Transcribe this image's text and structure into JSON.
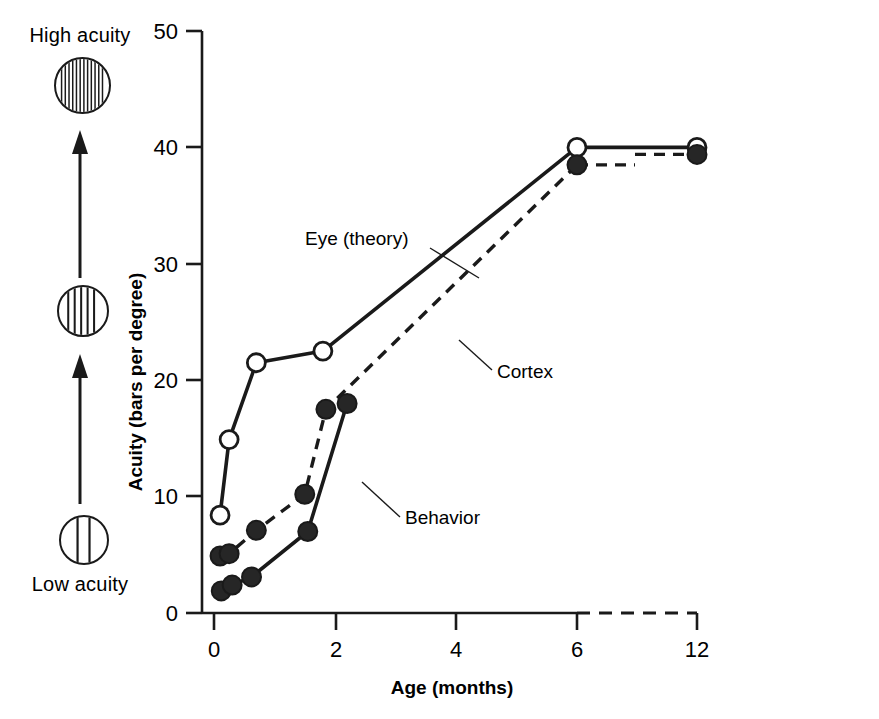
{
  "figure": {
    "acuity_scale": {
      "high_label": "High acuity",
      "low_label": "Low acuity",
      "gratings": [
        {
          "name": "high-acuity-grating",
          "bars": 13
        },
        {
          "name": "medium-acuity-grating",
          "bars": 6
        },
        {
          "name": "low-acuity-grating",
          "bars": 2
        }
      ]
    },
    "axes": {
      "y_title": "Acuity (bars per degree)",
      "x_title": "Age (months)",
      "y_ticks": [
        "0",
        "10",
        "20",
        "30",
        "40",
        "50"
      ],
      "x_ticks": [
        "0",
        "2",
        "4",
        "6",
        "12"
      ]
    },
    "annotations": {
      "eye_theory": "Eye (theory)",
      "cortex": "Cortex",
      "behavior": "Behavior"
    },
    "colors": {
      "ink": "#1a1a1a",
      "open_marker_fill": "#ffffff",
      "closed_marker_fill": "#262626"
    }
  },
  "chart_data": {
    "type": "line",
    "title": "",
    "xlabel": "Age (months)",
    "ylabel": "Acuity (bars per degree)",
    "xlim": [
      0,
      12
    ],
    "ylim": [
      0,
      50
    ],
    "x_ticks": [
      0,
      2,
      4,
      6,
      12
    ],
    "y_ticks": [
      0,
      10,
      20,
      30,
      40,
      50
    ],
    "grid": false,
    "legend": "inline annotations",
    "axis_break": {
      "between": [
        6,
        12
      ],
      "style": "dashed"
    },
    "series": [
      {
        "name": "Eye (theory)",
        "marker": "open-circle",
        "line": "solid",
        "points": [
          {
            "x": 0.1,
            "y": 8.4
          },
          {
            "x": 0.25,
            "y": 14.9
          },
          {
            "x": 0.7,
            "y": 21.5
          },
          {
            "x": 1.8,
            "y": 22.5
          },
          {
            "x": 6.0,
            "y": 40.0
          },
          {
            "x": 12.0,
            "y": 40.0
          }
        ]
      },
      {
        "name": "Cortex",
        "marker": "filled-circle",
        "line": "dashed",
        "points": [
          {
            "x": 0.1,
            "y": 4.9
          },
          {
            "x": 0.25,
            "y": 5.1
          },
          {
            "x": 0.7,
            "y": 7.1
          },
          {
            "x": 1.5,
            "y": 10.2
          },
          {
            "x": 1.85,
            "y": 17.5
          },
          {
            "x": 6.0,
            "y": 38.5
          },
          {
            "x": 12.0,
            "y": 39.4
          }
        ]
      },
      {
        "name": "Behavior",
        "marker": "filled-circle",
        "line": "solid",
        "points": [
          {
            "x": 0.12,
            "y": 1.9
          },
          {
            "x": 0.3,
            "y": 2.4
          },
          {
            "x": 0.62,
            "y": 3.1
          },
          {
            "x": 1.55,
            "y": 7.0
          },
          {
            "x": 2.2,
            "y": 18.0
          }
        ]
      }
    ]
  }
}
